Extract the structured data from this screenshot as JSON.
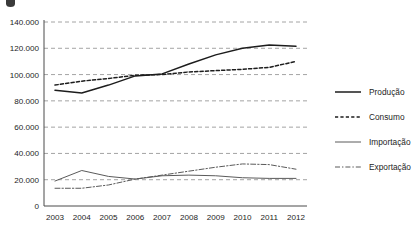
{
  "chart_data": {
    "type": "line",
    "title": "",
    "xlabel": "",
    "ylabel": "",
    "x": [
      2003,
      2004,
      2005,
      2006,
      2007,
      2008,
      2009,
      2010,
      2011,
      2012
    ],
    "categories": [
      "2003",
      "2004",
      "2005",
      "2006",
      "2007",
      "2008",
      "2009",
      "2010",
      "2011",
      "2012"
    ],
    "ylim": [
      0,
      140000
    ],
    "ytick_values": [
      0,
      20000,
      40000,
      60000,
      80000,
      100000,
      120000,
      140000
    ],
    "ytick_labels": [
      "0",
      "20.000",
      "40.000",
      "60.000",
      "80.000",
      "100.000",
      "120.000",
      "140.000"
    ],
    "grid": true,
    "grid_style": "dashed",
    "grid_color": "#9a9a9a",
    "legend_position": "right",
    "series": [
      {
        "name": "Produção",
        "style": "solid",
        "width": 1.5,
        "color": "#1d1d1d",
        "values": [
          88000,
          86000,
          92000,
          99000,
          100500,
          108000,
          115000,
          120000,
          122500,
          121500
        ]
      },
      {
        "name": "Consumo",
        "style": "dashed",
        "width": 1.5,
        "color": "#1d1d1d",
        "values": [
          92000,
          95000,
          97000,
          99500,
          100000,
          102000,
          103000,
          104000,
          105500,
          110000
        ]
      },
      {
        "name": "Importação",
        "style": "solid",
        "width": 1.0,
        "color": "#5a5a5a",
        "values": [
          19000,
          27000,
          22500,
          20500,
          23000,
          23500,
          23000,
          21500,
          21000,
          21000
        ]
      },
      {
        "name": "Exportação",
        "style": "dashdot",
        "width": 1.0,
        "color": "#5a5a5a",
        "values": [
          13500,
          13500,
          16000,
          20500,
          23500,
          26500,
          29500,
          32000,
          31500,
          28000
        ]
      }
    ]
  },
  "legend": {
    "items": [
      {
        "label": "Produção",
        "sample": "solid-thick-line"
      },
      {
        "label": "Consumo",
        "sample": "dashed-line"
      },
      {
        "label": "Importação",
        "sample": "solid-thin-line"
      },
      {
        "label": "Exportação",
        "sample": "dash-dot-line"
      }
    ]
  },
  "axis": {
    "y_axis_name": "y-axis",
    "x_axis_name": "x-axis"
  }
}
